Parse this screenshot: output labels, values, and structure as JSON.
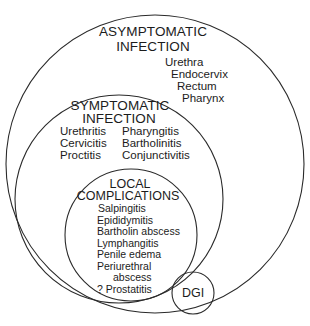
{
  "diagram": {
    "type": "nested-venn",
    "colors": {
      "background": "#ffffff",
      "stroke": "#2a2a2a",
      "text": "#1c1c1c"
    },
    "regions": {
      "asymptomatic": {
        "title_line1": "ASYMPTOMATIC",
        "title_line2": "INFECTION",
        "items": [
          "Urethra",
          "Endocervix",
          "Rectum",
          "Pharynx"
        ]
      },
      "symptomatic": {
        "title_line1": "SYMPTOMATIC",
        "title_line2": "INFECTION",
        "left_items": [
          "Urethritis",
          "Cervicitis",
          "Proctitis"
        ],
        "right_items": [
          "Pharyngitis",
          "Bartholinitis",
          "Conjunctivitis"
        ]
      },
      "local": {
        "title_line1": "LOCAL",
        "title_line2": "COMPLICATIONS",
        "items": [
          "Salpingitis",
          "Epididymitis",
          "Bartholin abscess",
          "Lymphangitis",
          "Penile edema",
          "Periurethral",
          "abscess",
          "? Prostatitis"
        ]
      },
      "dgi": {
        "label": "DGI"
      }
    }
  }
}
